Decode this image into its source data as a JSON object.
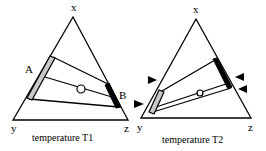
{
  "diagrams": [
    {
      "caption": "temperature T1",
      "vertices": {
        "top": "x",
        "left": "y",
        "right": "z"
      },
      "phase_labels": {
        "left": "A",
        "right": "B"
      }
    },
    {
      "caption": "temperature T2",
      "vertices": {
        "top": "x",
        "left": "y",
        "right": "z"
      }
    }
  ],
  "colors": {
    "line": "#000000",
    "gray_bar": "#c8c8c8",
    "background": "#ffffff"
  }
}
